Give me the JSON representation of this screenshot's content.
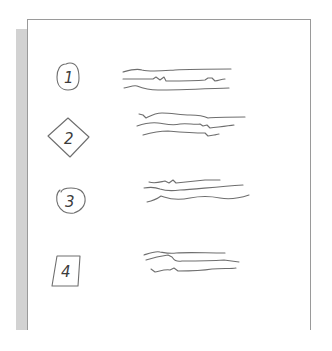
{
  "diagram": {
    "type": "wireframe-sketch",
    "page": {
      "border_color": "#9a9a9a",
      "shadow_color": "#d2d2d2",
      "background": "#ffffff"
    },
    "stroke_color": "#6e6e6e",
    "items": [
      {
        "number": "1",
        "marker_shape": "rounded-circle",
        "text_lines": 3
      },
      {
        "number": "2",
        "marker_shape": "diamond",
        "text_lines": 3
      },
      {
        "number": "3",
        "marker_shape": "circle",
        "text_lines": 3
      },
      {
        "number": "4",
        "marker_shape": "skewed-square",
        "text_lines": 3
      }
    ]
  }
}
